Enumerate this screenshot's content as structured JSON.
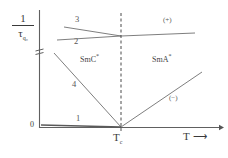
{
  "figure": {
    "type": "scientific-plot",
    "background": "#ffffff",
    "line_color": "#6b6b6b",
    "axis_color": "#555555",
    "text_color": "#3a3a3a"
  },
  "axes": {
    "y_label_numerator": "1",
    "y_label_denominator": "τ",
    "y_label_denominator_sub": "q₀",
    "y_origin_tick": "0",
    "y_axis_break_icon": "axis-break-icon",
    "x_label": "T",
    "x_label_arrow": "⟶",
    "x_tick_label": "T",
    "x_tick_label_sub": "c"
  },
  "annotations": {
    "curve_1": "1",
    "curve_2": "2",
    "curve_3": "3",
    "curve_4": "4",
    "phase_left": "SmC",
    "phase_left_sup": "*",
    "phase_right": "SmA",
    "phase_right_sup": "*",
    "sign_positive": "(+)",
    "sign_negative": "(−)"
  },
  "chart_data": {
    "type": "line",
    "title": "",
    "xlabel": "T",
    "ylabel": "1/τ_q0",
    "xlim": [
      0,
      228
    ],
    "ylim": [
      0,
      158
    ],
    "grid": false,
    "legend": "none",
    "axis_break": true,
    "critical_temperature_x": 121,
    "series": [
      {
        "name": "1",
        "label": "1",
        "description": "flat low branch along baseline in SmC* phase",
        "points": [
          [
            41,
            125
          ],
          [
            121,
            127
          ]
        ]
      },
      {
        "name": "2",
        "label": "2",
        "description": "upper-region lower line rising slightly to the right of Tc",
        "points": [
          [
            57,
            40
          ],
          [
            121,
            36
          ],
          [
            195,
            33
          ]
        ]
      },
      {
        "name": "3",
        "label": "3",
        "description": "upper-region upper line descending toward Tc",
        "points": [
          [
            64,
            27
          ],
          [
            121,
            36
          ]
        ]
      },
      {
        "name": "4",
        "label": "4",
        "description": "steeply descending soft-mode branch in SmC* meeting Tc at baseline",
        "points": [
          [
            54,
            53
          ],
          [
            121,
            127
          ]
        ]
      },
      {
        "name": "5",
        "label": "(−)",
        "description": "ascending branch in SmA* rising from Tc",
        "points": [
          [
            121,
            127
          ],
          [
            202,
            72
          ]
        ]
      }
    ],
    "annotation_positions": {
      "curve_1": [
        75,
        114
      ],
      "curve_2": [
        76,
        41
      ],
      "curve_3": [
        76,
        20
      ],
      "curve_4": [
        74,
        84
      ],
      "phase_left": [
        82,
        54
      ],
      "phase_right": [
        155,
        54
      ],
      "sign_positive": [
        166,
        21
      ],
      "sign_negative": [
        172,
        99
      ]
    }
  }
}
